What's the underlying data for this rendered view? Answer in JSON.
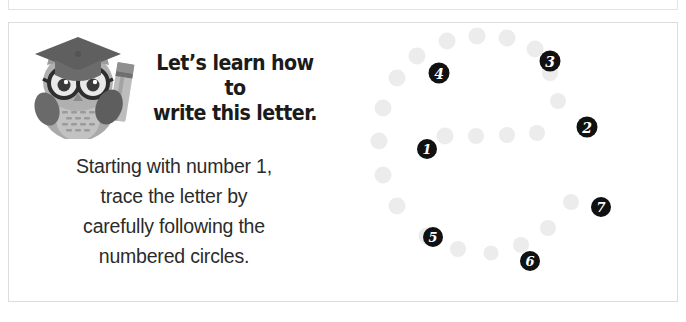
{
  "page": {
    "background_color": "#ffffff",
    "card_border_color": "#dcdcdc"
  },
  "top_strip": {
    "visible": true,
    "note_clipped": true
  },
  "worksheet": {
    "mascot": {
      "icon": "owl-graduate-with-pencil-icon",
      "body_color": "#a8a8a8",
      "cap_color": "#6e6e6e",
      "accent_color": "#8d8d8d"
    },
    "heading": {
      "line1": "Let’s learn how to",
      "line2": "write this letter.",
      "color": "#1b1b1b"
    },
    "instructions": {
      "line1": "Starting with number 1,",
      "line2": "trace the letter by",
      "line3": "carefully following the",
      "line4": "numbered circles.",
      "color": "#2b2b2b"
    }
  },
  "tracing": {
    "letter": "e",
    "dot_color": "#ececec",
    "number_circle_color": "#111111",
    "number_text_color": "#ffffff",
    "guide_dots": [
      {
        "x": 108,
        "y": 18,
        "d": 17
      },
      {
        "x": 138,
        "y": 13,
        "d": 17
      },
      {
        "x": 168,
        "y": 15,
        "d": 17
      },
      {
        "x": 196,
        "y": 26,
        "d": 17
      },
      {
        "x": 78,
        "y": 33,
        "d": 17
      },
      {
        "x": 58,
        "y": 55,
        "d": 17
      },
      {
        "x": 211,
        "y": 50,
        "d": 16
      },
      {
        "x": 219,
        "y": 78,
        "d": 16
      },
      {
        "x": 44,
        "y": 85,
        "d": 17
      },
      {
        "x": 106,
        "y": 113,
        "d": 17
      },
      {
        "x": 137,
        "y": 113,
        "d": 16
      },
      {
        "x": 168,
        "y": 112,
        "d": 16
      },
      {
        "x": 198,
        "y": 110,
        "d": 16
      },
      {
        "x": 40,
        "y": 118,
        "d": 17
      },
      {
        "x": 44,
        "y": 152,
        "d": 17
      },
      {
        "x": 58,
        "y": 183,
        "d": 17
      },
      {
        "x": 88,
        "y": 213,
        "d": 17
      },
      {
        "x": 119,
        "y": 226,
        "d": 16
      },
      {
        "x": 152,
        "y": 230,
        "d": 15
      },
      {
        "x": 182,
        "y": 222,
        "d": 16
      },
      {
        "x": 209,
        "y": 205,
        "d": 16
      },
      {
        "x": 232,
        "y": 179,
        "d": 16
      }
    ],
    "numbers": [
      {
        "label": "1",
        "x": 88,
        "y": 126,
        "d": 20
      },
      {
        "label": "2",
        "x": 248,
        "y": 104,
        "d": 21
      },
      {
        "label": "3",
        "x": 211,
        "y": 38,
        "d": 21
      },
      {
        "label": "4",
        "x": 100,
        "y": 50,
        "d": 21
      },
      {
        "label": "5",
        "x": 94,
        "y": 214,
        "d": 20
      },
      {
        "label": "6",
        "x": 191,
        "y": 238,
        "d": 20
      },
      {
        "label": "7",
        "x": 262,
        "y": 184,
        "d": 20
      }
    ]
  }
}
